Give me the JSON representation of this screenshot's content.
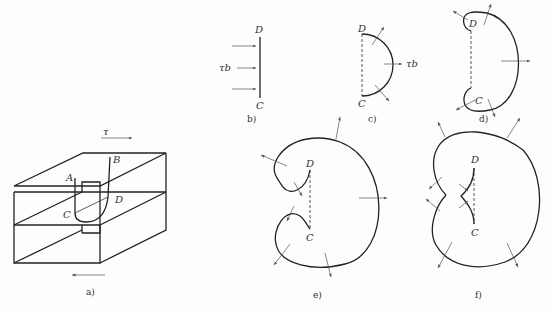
{
  "figure": {
    "panels": {
      "a": {
        "caption": "a)",
        "labels": {
          "A": "A",
          "B": "B",
          "C": "C",
          "D": "D"
        },
        "shear_symbol": "τ"
      },
      "b": {
        "caption": "b)",
        "labels": {
          "D": "D",
          "C": "C"
        },
        "force_label": "τb"
      },
      "c": {
        "caption": "c)",
        "labels": {
          "D": "D",
          "C": "C"
        },
        "force_label": "τb"
      },
      "d": {
        "caption": "d)",
        "labels": {
          "D": "D",
          "C": "C"
        }
      },
      "e": {
        "caption": "e)",
        "labels": {
          "D": "D",
          "C": "C"
        }
      },
      "f": {
        "caption": "f)",
        "labels": {
          "D": "D",
          "C": "C"
        }
      }
    }
  }
}
